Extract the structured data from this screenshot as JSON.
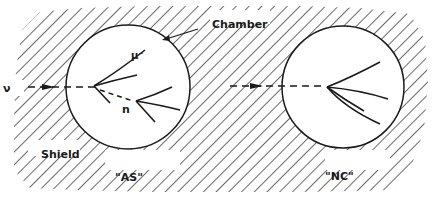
{
  "diagram": {
    "type": "neutrino-detector-schematic",
    "labels": {
      "chamber": "Chamber",
      "shield": "Shield",
      "neutrino": "ν",
      "muon": "μ⁻",
      "neutron": "n",
      "event_as": "\"AS\"",
      "event_nc": "\"NC\""
    },
    "panels": [
      {
        "id": "AS",
        "caption": "\"AS\"",
        "description": "Incoming neutrino interacts in chamber producing μ⁻ and hadron tracks; neutral neutron travels (dashed) and interacts producing secondary tracks"
      },
      {
        "id": "NC",
        "caption": "\"NC\"",
        "description": "Incoming neutrino (dashed) interacts in chamber producing a fan of hadron tracks with no muon"
      }
    ],
    "colors": {
      "ink": "#1a1a1a",
      "background": "#ffffff"
    }
  }
}
